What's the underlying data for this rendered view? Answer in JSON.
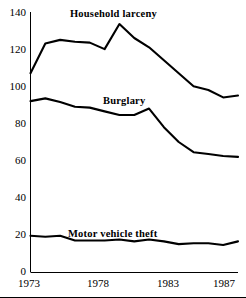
{
  "chart_data": {
    "type": "line",
    "title": "",
    "subtitle": "",
    "xlabel": "",
    "ylabel": "",
    "xlim": [
      1973,
      1987
    ],
    "ylim": [
      0,
      140
    ],
    "grid": false,
    "legend_position": "inline-annotation",
    "x": [
      1973,
      1974,
      1975,
      1976,
      1977,
      1978,
      1979,
      1980,
      1981,
      1982,
      1983,
      1984,
      1985,
      1986,
      1987
    ],
    "x_tick_labels": [
      "1973",
      "1978",
      "1983",
      "1987"
    ],
    "x_ticks": [
      1973,
      1978,
      1983,
      1987
    ],
    "y_tick_labels": [
      "0",
      "20",
      "40",
      "60",
      "80",
      "100",
      "120",
      "140"
    ],
    "y_ticks": [
      0,
      20,
      40,
      60,
      80,
      100,
      120,
      140
    ],
    "series": [
      {
        "name": "Household larceny",
        "color": "#000000",
        "values": [
          107,
          123,
          125,
          124,
          123.5,
          120,
          133.5,
          126,
          121,
          114,
          107,
          100,
          98,
          94,
          95
        ]
      },
      {
        "name": "Burglary",
        "color": "#000000",
        "values": [
          92,
          93.5,
          91.5,
          89,
          88.5,
          86.5,
          84.5,
          84.5,
          88,
          78,
          70,
          64.5,
          63.5,
          62.5,
          62
        ]
      },
      {
        "name": "Motor vehicle theft",
        "color": "#000000",
        "values": [
          19.5,
          19,
          19.5,
          17,
          17,
          17,
          17.5,
          16.5,
          17.5,
          16.5,
          15,
          15.5,
          15.5,
          14.5,
          16.5
        ]
      }
    ],
    "annotations": [
      {
        "text": "Household larceny",
        "series": "Household larceny"
      },
      {
        "text": "Burglary",
        "series": "Burglary"
      },
      {
        "text": "Motor vehicle theft",
        "series": "Motor vehicle theft"
      }
    ]
  },
  "axes": {
    "y_labels": [
      "140",
      "120",
      "100",
      "80",
      "60",
      "40",
      "20",
      "0"
    ],
    "x_labels": [
      "1973",
      "1978",
      "1983",
      "1987"
    ]
  },
  "labels": {
    "household_larceny": "Household larceny",
    "burglary": "Burglary",
    "motor_vehicle_theft": "Motor vehicle theft"
  }
}
